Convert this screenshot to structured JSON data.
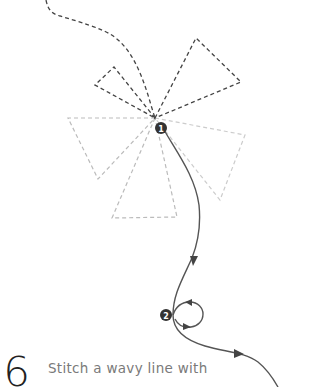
{
  "diagram": {
    "markers": [
      {
        "label": "1"
      },
      {
        "label": "2"
      }
    ],
    "colors": {
      "dark_dash": "#444444",
      "light_dash": "#bbbbbb",
      "stitch_path": "#555555",
      "marker_fill": "#333333",
      "marker_text": "#ffffff"
    }
  },
  "step": {
    "number": "6",
    "text": "Stitch a wavy line with"
  }
}
